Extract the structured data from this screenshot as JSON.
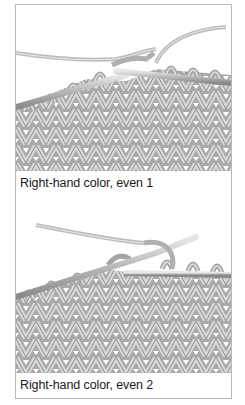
{
  "figures": [
    {
      "caption": "Right-hand color, even 1",
      "illustration": "knitting-stitches-right-hand-color-step-1"
    },
    {
      "caption": "Right-hand color, even 2",
      "illustration": "knitting-stitches-right-hand-color-step-2"
    }
  ],
  "colors": {
    "yarn": "#bdbdbd",
    "yarn_shadow": "#8f8f8f",
    "yarn_highlight": "#e6e6e6",
    "frame_border": "#b9b9b9",
    "caption_text": "#1a1a1a"
  }
}
